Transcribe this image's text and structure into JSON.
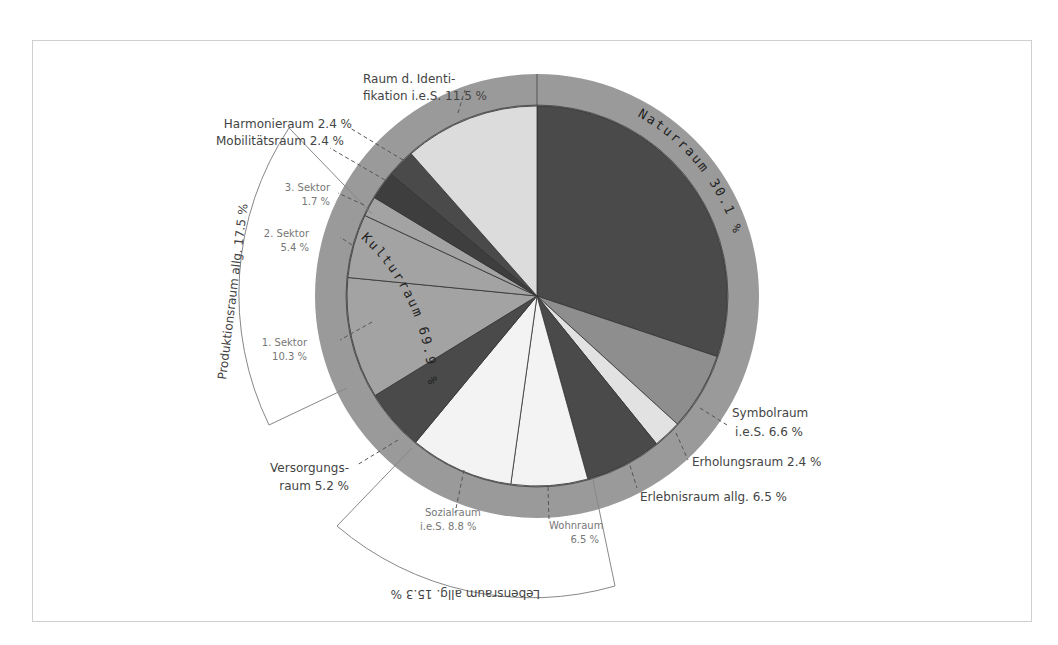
{
  "chart_data": {
    "type": "pie",
    "title": "",
    "center": [
      537,
      296
    ],
    "inner_radius": 190,
    "outer_radius": 222,
    "slices": [
      {
        "name": "Naturraum",
        "value": 30.1,
        "color": "#4a4a4a",
        "group": "Naturraum"
      },
      {
        "name": "Symbolraum i.e.S.",
        "value": 6.6,
        "color": "#8e8e8e",
        "group": "Kulturraum"
      },
      {
        "name": "Erholungsraum",
        "value": 2.4,
        "color": "#e2e2e2",
        "group": "Kulturraum"
      },
      {
        "name": "Erlebnisraum allg.",
        "value": 6.5,
        "color": "#4a4a4a",
        "group": "Kulturraum"
      },
      {
        "name": "Wohnraum",
        "value": 6.5,
        "color": "#f3f3f3",
        "group": "Lebensraum allg."
      },
      {
        "name": "Sozialraum i.e.S.",
        "value": 8.8,
        "color": "#f3f3f3",
        "group": "Lebensraum allg."
      },
      {
        "name": "Versorgungsraum",
        "value": 5.2,
        "color": "#4a4a4a",
        "group": "Kulturraum"
      },
      {
        "name": "1. Sektor",
        "value": 10.3,
        "color": "#a3a3a3",
        "group": "Produktionsraum allg."
      },
      {
        "name": "2. Sektor",
        "value": 5.4,
        "color": "#a3a3a3",
        "group": "Produktionsraum allg."
      },
      {
        "name": "3. Sektor",
        "value": 1.7,
        "color": "#a3a3a3",
        "group": "Produktionsraum allg."
      },
      {
        "name": "Mobilitätsraum",
        "value": 2.4,
        "color": "#3e3e3e",
        "group": "Kulturraum"
      },
      {
        "name": "Harmonieraum",
        "value": 2.4,
        "color": "#4a4a4a",
        "group": "Kulturraum"
      },
      {
        "name": "Raum d. Identifikation i.e.S.",
        "value": 11.5,
        "color": "#dcdcdc",
        "group": "Kulturraum"
      }
    ],
    "ring_groups": [
      {
        "name": "Naturraum",
        "value": 30.1,
        "label": "Naturraum 30.1 %"
      },
      {
        "name": "Kulturraum",
        "value": 69.9,
        "label": "Kulturraum 69.9 %"
      }
    ],
    "brackets": [
      {
        "name": "Produktionsraum allg.",
        "value": 17.5,
        "label": "Produktionsraum allg. 17.5 %"
      },
      {
        "name": "Lebensraum allg.",
        "value": 15.3,
        "label": "Lebensraum allg. 15.3 %"
      }
    ],
    "legend": "none"
  },
  "labels": {
    "identifikation_1": "Raum d. Identi-",
    "identifikation_2": "fikation i.e.S. 11.5 %",
    "harmonie": "Harmonieraum 2.4 %",
    "mobilitaet": "Mobilitätsraum 2.4 %",
    "sektor3_1": "3. Sektor",
    "sektor3_2": "1.7 %",
    "sektor2_1": "2. Sektor",
    "sektor2_2": "5.4 %",
    "sektor1_1": "1. Sektor",
    "sektor1_2": "10.3 %",
    "versorgung_1": "Versorgungs-",
    "versorgung_2": "raum 5.2 %",
    "sozial_1": "Sozialraum",
    "sozial_2": "i.e.S.  8.8 %",
    "wohn_1": "Wohnraum",
    "wohn_2": "6.5 %",
    "erlebnis": "Erlebnisraum allg. 6.5 %",
    "erholung": "Erholungsraum 2.4 %",
    "symbol_1": "Symbolraum",
    "symbol_2": "i.e.S. 6.6 %",
    "naturraum_ring": "Naturraum 30.1 %",
    "kulturraum_ring": "Kulturraum 69.9 %",
    "produktion_bracket": "Produktionsraum allg. 17.5 %",
    "lebensraum_bracket": "Lebensraum allg. 15.3 %"
  },
  "colors": {
    "ring": "#9a9a9a",
    "frame": "#cfcfcf",
    "slice_stroke": "#333333",
    "bracket": "#888888"
  }
}
